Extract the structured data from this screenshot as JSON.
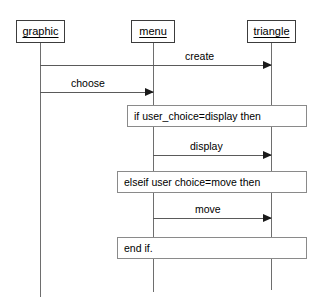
{
  "diagram": {
    "type": "uml-sequence-diagram",
    "background_color": "#ffffff",
    "line_color": "#5a5a5a",
    "text_color": "#000000",
    "participants": [
      {
        "id": "graphic",
        "label": "graphic"
      },
      {
        "id": "menu",
        "label": "menu"
      },
      {
        "id": "triangle",
        "label": "triangle"
      }
    ],
    "messages": [
      {
        "id": "create",
        "label": "create",
        "from": "graphic",
        "to": "triangle"
      },
      {
        "id": "choose",
        "label": "choose",
        "from": "graphic",
        "to": "menu"
      },
      {
        "id": "display",
        "label": "display",
        "from": "menu",
        "to": "triangle"
      },
      {
        "id": "move",
        "label": "move",
        "from": "menu",
        "to": "triangle"
      }
    ],
    "fragments": [
      {
        "id": "if-branch",
        "label": "if user_choice=display then"
      },
      {
        "id": "elseif-branch",
        "label": "elseif user choice=move then"
      },
      {
        "id": "end-if",
        "label": "end if."
      }
    ]
  }
}
